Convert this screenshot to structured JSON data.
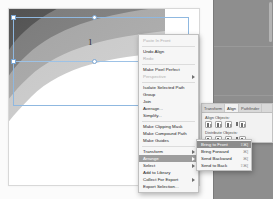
{
  "app": {
    "name": "Adobe Illustrator",
    "document_number": "1"
  },
  "canvas": {
    "artwork_name": "leaf-gradient-artwork",
    "selection": {
      "handle_count": 4,
      "marker_label": "1"
    },
    "shape_colors": {
      "dark": "#4f4f4f",
      "mid_dark": "#767676",
      "mid": "#9e9e9e",
      "light": "#c2c2c2",
      "pale": "#d9d9d9"
    },
    "artboard_background": "#ffffff",
    "canvas_background": "#fbfbfb"
  },
  "dock": {
    "background_color": "#8e8e8e",
    "scrollbar_name": "panel-scrollbar"
  },
  "align_panel": {
    "tabs": [
      {
        "label": "Transform",
        "active": false
      },
      {
        "label": "Align",
        "active": true
      },
      {
        "label": "Pathfinder",
        "active": false
      }
    ],
    "sections": [
      {
        "label": "Align Objects:",
        "buttons": [
          "align-left-icon",
          "align-center-horizontal-icon",
          "align-right-icon",
          "align-top-icon"
        ]
      },
      {
        "label": "Distribute Objects:",
        "buttons": [
          "distribute-top-icon",
          "distribute-center-vertical-icon",
          "distribute-bottom-icon",
          "distribute-left-icon"
        ]
      }
    ]
  },
  "context_menu": {
    "items": [
      {
        "label": "Paste In Front",
        "disabled": true,
        "submenu": false,
        "highlight": false
      },
      {
        "separator": true
      },
      {
        "label": "Undo Align",
        "disabled": false,
        "submenu": false,
        "highlight": false
      },
      {
        "label": "Redo",
        "disabled": true,
        "submenu": false,
        "highlight": false
      },
      {
        "separator": true
      },
      {
        "label": "Make Pixel Perfect",
        "disabled": false,
        "submenu": false,
        "highlight": false
      },
      {
        "label": "Perspective",
        "disabled": true,
        "submenu": true,
        "highlight": false
      },
      {
        "separator": true
      },
      {
        "label": "Isolate Selected Path",
        "disabled": false,
        "submenu": false,
        "highlight": false
      },
      {
        "label": "Group",
        "disabled": false,
        "submenu": false,
        "highlight": false
      },
      {
        "label": "Join",
        "disabled": false,
        "submenu": false,
        "highlight": false
      },
      {
        "label": "Average...",
        "disabled": false,
        "submenu": false,
        "highlight": false
      },
      {
        "label": "Simplify...",
        "disabled": false,
        "submenu": false,
        "highlight": false
      },
      {
        "separator": true
      },
      {
        "label": "Make Clipping Mask",
        "disabled": false,
        "submenu": false,
        "highlight": false
      },
      {
        "label": "Make Compound Path",
        "disabled": false,
        "submenu": false,
        "highlight": false
      },
      {
        "label": "Make Guides",
        "disabled": false,
        "submenu": false,
        "highlight": false
      },
      {
        "separator": true
      },
      {
        "label": "Transform",
        "disabled": false,
        "submenu": true,
        "highlight": false
      },
      {
        "label": "Arrange",
        "disabled": false,
        "submenu": true,
        "highlight": true
      },
      {
        "label": "Select",
        "disabled": false,
        "submenu": true,
        "highlight": false
      },
      {
        "label": "Add to Library",
        "disabled": false,
        "submenu": false,
        "highlight": false
      },
      {
        "label": "Collect For Export",
        "disabled": false,
        "submenu": true,
        "highlight": false
      },
      {
        "label": "Export Selection...",
        "disabled": false,
        "submenu": false,
        "highlight": false
      }
    ]
  },
  "arrange_submenu": {
    "items": [
      {
        "label": "Bring to Front",
        "shortcut": "⇧⌘]",
        "highlight": true
      },
      {
        "label": "Bring Forward",
        "shortcut": "⌘]",
        "highlight": false
      },
      {
        "label": "Send Backward",
        "shortcut": "⌘[",
        "highlight": false
      },
      {
        "label": "Send to Back",
        "shortcut": "⇧⌘[",
        "highlight": false
      }
    ]
  }
}
